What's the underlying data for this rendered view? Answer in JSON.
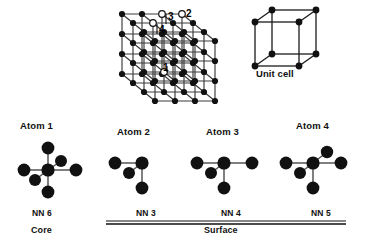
{
  "figure": {
    "background_color": "#ffffff",
    "atom_color": "#111111",
    "bond_color": "#444444",
    "open_atom_fill": "#ffffff",
    "width": 365,
    "height": 243
  },
  "lattice": {
    "label_unit_cell": "Unit cell",
    "grid_cells": 3,
    "markers": [
      {
        "id": "1",
        "label": "1",
        "type": "open",
        "description": "body-interior atom, fully coordinated core site"
      },
      {
        "id": "2",
        "label": "2",
        "type": "open",
        "description": "corner atom of the lattice"
      },
      {
        "id": "3",
        "label": "3",
        "type": "open",
        "description": "top-face edge atom"
      },
      {
        "id": "4",
        "label": "4",
        "type": "open",
        "description": "top-face interior atom"
      }
    ]
  },
  "atoms": [
    {
      "id": "atom-1",
      "label": "Atom 1",
      "nn_label": "NN 6",
      "nn_count": 6,
      "zone": "Core"
    },
    {
      "id": "atom-2",
      "label": "Atom 2",
      "nn_label": "NN 3",
      "nn_count": 3,
      "zone": "Surface"
    },
    {
      "id": "atom-3",
      "label": "Atom 3",
      "nn_label": "NN 4",
      "nn_count": 4,
      "zone": "Surface"
    },
    {
      "id": "atom-4",
      "label": "Atom 4",
      "nn_label": "NN 5",
      "nn_count": 5,
      "zone": "Surface"
    }
  ],
  "zones": {
    "core_label": "Core",
    "surface_label": "Surface"
  }
}
